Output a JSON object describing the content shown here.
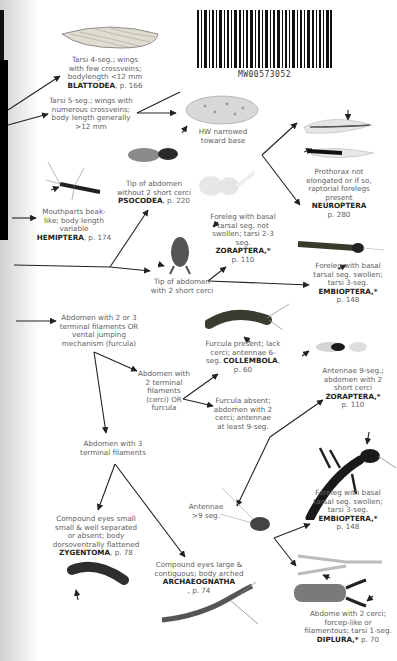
{
  "barcode": {
    "text": "MW00573052"
  },
  "nodes": {
    "blattodea": {
      "text": "Tarsi 4-seg.; wings with few crossveins; bodylength <12 mm",
      "taxon": "BLATTODEA",
      "page": ", p. 166"
    },
    "tarsi5": {
      "text": "Tarsi 5-seg.; wings with numerous crossveins; body length generally >12 mm"
    },
    "hw_narrowed": {
      "text": "HW narrowed toward base"
    },
    "neuroptera": {
      "text": "Prothorax not elongated or if so, raptorial forelegs present",
      "taxon": "NEUROPTERA",
      "page": "p. 280"
    },
    "hemiptera": {
      "text": "Mouthparts beak-like; body length variable",
      "taxon": "HEMIPTERA",
      "page": ", p. 174"
    },
    "psocodea": {
      "text": "Tip of abdomen without 2 short cerci",
      "taxon": "PSOCODEA",
      "page": ", p. 220"
    },
    "zoraptera1": {
      "text": "Foreleg with basal tarsal seg. not swollen; tarsi 2-3 seg.",
      "taxon": "ZORAPTERA,*",
      "page": "p. 110"
    },
    "tip_2cerci": {
      "text": "Tip of abdomen with 2 short cerci"
    },
    "embioptera1": {
      "text": "Foreleg with basal tarsal seg. swollen; tarsi 3-seg.",
      "taxon": "EMBIOPTERA,*",
      "page": "p. 148"
    },
    "abdomen_2or3": {
      "text": "Abdomen with 2 or 3 terminal filaments OR vental jumping mechanism (furcula)"
    },
    "collembola": {
      "text": "Furcula present; lack cerci; antennae 6-seg.",
      "taxon": "COLLEMBOLA",
      "page": ", p. 60"
    },
    "abdomen_2": {
      "text": "Abdomen with 2 terminal filaments (cerci) OR furcula"
    },
    "zoraptera2": {
      "text": "Antennae 9-seg.; abdomen with 2 short cerci",
      "taxon": "ZORAPTERA,*",
      "page": "p. 110"
    },
    "furcula_absent": {
      "text": "Furcula absent; abdomen with 2 cerci; antennae at least 9-seg."
    },
    "abdomen_3": {
      "text": "Abdomen with 3 terminal filaments"
    },
    "embioptera2": {
      "text": "Foreleg with basal tarsal seg. swollen; tarsi 3-seg.",
      "taxon": "EMBIOPTERA,*",
      "page": "p. 148"
    },
    "antennae9": {
      "text": "Antennae >9 seg."
    },
    "zygentoma": {
      "text": "Compound eyes small small & well separated or absent; body dorsoventrally flattened",
      "taxon": "ZYGENTOMA",
      "page": ", p. 78"
    },
    "archaeognatha": {
      "text": "Compound eyes large & contiguous; body arched",
      "taxon": "ARCHAEOGNATHA",
      "page": ", p. 74"
    },
    "diplura": {
      "text": "Abdome with 2 cerci; forcep-like or filamentous; tarsi 1-seg.",
      "taxon": "DIPLURA,*",
      "page": " p. 70"
    }
  },
  "colors": {
    "text": "#606060",
    "taxon": "#1e1e1e",
    "arrow": "#222222"
  }
}
